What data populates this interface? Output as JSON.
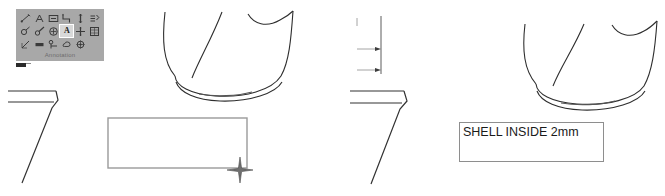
{
  "app": {
    "view_background": "#ffffff",
    "line_color": "#2e2e2e"
  },
  "toolbar": {
    "name": "Annotation",
    "label": "Annotation",
    "background_color": "#a8a8a8",
    "selected_tool": "text-annotation",
    "selected_tool_label": "A",
    "rows": 3,
    "columns": 6,
    "icons": [
      {
        "name": "dimension-linear-icon",
        "glyph": "linear-dim"
      },
      {
        "name": "dimension-angular-icon",
        "glyph": "angular-dim"
      },
      {
        "name": "dimension-baseline-icon",
        "glyph": "baseline-dim"
      },
      {
        "name": "dimension-ordinate-icon",
        "glyph": "ordinate-dim"
      },
      {
        "name": "datum-feature-icon",
        "glyph": "datum"
      },
      {
        "name": "surface-finish-icon",
        "glyph": "finish"
      },
      {
        "name": "dimension-radial-icon",
        "glyph": "radial-dim"
      },
      {
        "name": "dimension-diameter-icon",
        "glyph": "diameter-dim"
      },
      {
        "name": "hole-callout-icon",
        "glyph": "hole-callout"
      },
      {
        "name": "text-annotation-icon",
        "glyph": "A"
      },
      {
        "name": "centerline-icon",
        "glyph": "centerline"
      },
      {
        "name": "table-note-icon",
        "glyph": "table"
      },
      {
        "name": "chamfer-dimension-icon",
        "glyph": "chamfer"
      },
      {
        "name": "weld-symbol-icon",
        "glyph": "weld"
      },
      {
        "name": "balloon-leader-icon",
        "glyph": "balloon"
      },
      {
        "name": "revision-cloud-icon",
        "glyph": "cloud"
      },
      {
        "name": "center-mark-icon",
        "glyph": "center-mark"
      }
    ]
  },
  "left_panel": {
    "name": "before-state",
    "geometry": [
      {
        "name": "shell-profile-curve",
        "type": "freeform-curve"
      },
      {
        "name": "wall-section-edge",
        "type": "angular-edge"
      }
    ],
    "empty_label_box": {
      "name": "empty-annotation-box",
      "text": "",
      "placeholder": "",
      "border_color": "#9a9a9a",
      "x": 108,
      "y": 118,
      "width": 139,
      "height": 50
    },
    "cursor": {
      "name": "crosshair-cursor",
      "x": 240,
      "y": 170
    }
  },
  "right_panel": {
    "name": "after-state",
    "geometry": [
      {
        "name": "shell-profile-curve",
        "type": "freeform-curve"
      },
      {
        "name": "wall-section-edge",
        "type": "angular-edge"
      }
    ],
    "dimension_marks": {
      "name": "thickness-dimension",
      "arrow_count": 2
    },
    "label_box": {
      "name": "shell-annotation-box",
      "text": "SHELL INSIDE 2mm",
      "border_color": "#8e8e8e",
      "text_color": "#1a1a1a",
      "x": 459,
      "y": 122,
      "width": 145,
      "height": 40
    }
  }
}
